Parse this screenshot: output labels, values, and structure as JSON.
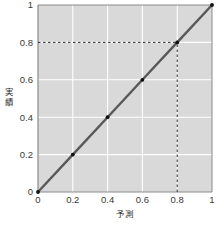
{
  "chart_data": {
    "type": "line",
    "title": "",
    "subtitle": "",
    "xlabel": "予測",
    "ylabel": "実績",
    "xlim": [
      0,
      1
    ],
    "ylim": [
      0,
      1
    ],
    "grid": true,
    "legend": false,
    "legend_position": "none",
    "x_ticks": [
      "0",
      "0.2",
      "0.4",
      "0.6",
      "0.8",
      "1"
    ],
    "y_ticks": [
      "0",
      "0.2",
      "0.4",
      "0.6",
      "0.8",
      "1"
    ],
    "x_tick_values": [
      0,
      0.2,
      0.4,
      0.6,
      0.8,
      1
    ],
    "y_tick_values": [
      0,
      0.2,
      0.4,
      0.6,
      0.8,
      1
    ],
    "series": [
      {
        "name": "identity-line",
        "x": [
          0,
          0.2,
          0.4,
          0.6,
          0.8,
          1
        ],
        "values": [
          0,
          0.2,
          0.4,
          0.6,
          0.8,
          1
        ],
        "color": "#585858",
        "marker": "dot",
        "marker_color": "#111111"
      }
    ],
    "annotations": [
      {
        "name": "reference-horizontal",
        "kind": "dashed-line",
        "orientation": "horizontal",
        "value": 0.8,
        "from": 0,
        "to": 0.8,
        "color": "#2b2b2b"
      },
      {
        "name": "reference-vertical",
        "kind": "dashed-line",
        "orientation": "vertical",
        "value": 0.8,
        "from": 0,
        "to": 0.8,
        "color": "#2b2b2b"
      }
    ],
    "colors": {
      "plot_background": "#d9d9d9",
      "grid": "#ffffff",
      "frame": "#8a8a8a",
      "line": "#585858",
      "marker": "#111111",
      "dash": "#2b2b2b",
      "text": "#2b2b2b",
      "page_background": "#ffffff"
    }
  },
  "axes": {
    "x": {
      "label": "予測",
      "ticks": [
        {
          "label": "0",
          "value": 0
        },
        {
          "label": "0.2",
          "value": 0.2
        },
        {
          "label": "0.4",
          "value": 0.4
        },
        {
          "label": "0.6",
          "value": 0.6
        },
        {
          "label": "0.8",
          "value": 0.8
        },
        {
          "label": "1",
          "value": 1
        }
      ]
    },
    "y": {
      "label": "実績",
      "label_chars": [
        "実",
        "績"
      ],
      "ticks": [
        {
          "label": "0",
          "value": 0
        },
        {
          "label": "0.2",
          "value": 0.2
        },
        {
          "label": "0.4",
          "value": 0.4
        },
        {
          "label": "0.6",
          "value": 0.6
        },
        {
          "label": "0.8",
          "value": 0.8
        },
        {
          "label": "1",
          "value": 1
        }
      ]
    }
  }
}
